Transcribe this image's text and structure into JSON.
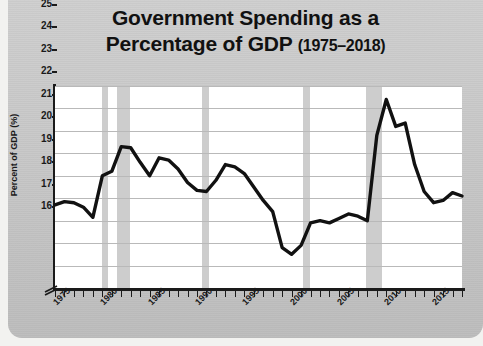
{
  "title": {
    "line1": "Government Spending as a",
    "line2": "Percentage of GDP",
    "years": "(1975–2018)"
  },
  "axes": {
    "ylabel": "Percent of GDP (%)",
    "y_ticks": [
      "25",
      "24",
      "23",
      "22",
      "21",
      "20",
      "19",
      "18",
      "17",
      "16"
    ],
    "x_ticks": [
      "1975",
      "1980",
      "1985",
      "1990",
      "1995",
      "2000",
      "2005",
      "2010",
      "2015"
    ],
    "axis_break": "axis-break-symbol"
  },
  "colors": {
    "line": "#111111",
    "grid": "#b9b9b9",
    "recession_band": "#c4c4c4",
    "panel": "#c8c8c8",
    "plot_bg": "#ffffff",
    "text": "#1a1a1a"
  },
  "chart_data": {
    "type": "line",
    "title": "Government Spending as a Percentage of GDP (1975–2018)",
    "xlabel": "",
    "ylabel": "Percent of GDP (%)",
    "xlim": [
      1975,
      2018
    ],
    "ylim": [
      16,
      25
    ],
    "grid": true,
    "legend": "none",
    "axis_break_y": true,
    "x": [
      1975,
      1976,
      1977,
      1978,
      1979,
      1980,
      1981,
      1982,
      1983,
      1984,
      1985,
      1986,
      1987,
      1988,
      1989,
      1990,
      1991,
      1992,
      1993,
      1994,
      1995,
      1996,
      1997,
      1998,
      1999,
      2000,
      2001,
      2002,
      2003,
      2004,
      2005,
      2006,
      2007,
      2008,
      2009,
      2010,
      2011,
      2012,
      2013,
      2014,
      2015,
      2016,
      2017,
      2018
    ],
    "values": [
      19.7,
      19.85,
      19.8,
      19.6,
      19.15,
      21.0,
      21.2,
      22.3,
      22.25,
      21.6,
      21.0,
      21.8,
      21.7,
      21.3,
      20.7,
      20.35,
      20.3,
      20.8,
      21.5,
      21.4,
      21.1,
      20.5,
      19.9,
      19.4,
      17.8,
      17.5,
      17.9,
      18.9,
      19.0,
      18.9,
      19.1,
      19.3,
      19.2,
      19.0,
      22.8,
      24.4,
      23.2,
      23.35,
      21.5,
      20.3,
      19.8,
      19.9,
      20.25,
      20.1
    ],
    "units": "percent of GDP",
    "recession_bands": [
      {
        "start": 1980.0,
        "end": 1980.6
      },
      {
        "start": 1981.5,
        "end": 1982.9
      },
      {
        "start": 1990.5,
        "end": 1991.3
      },
      {
        "start": 2001.2,
        "end": 2001.9
      },
      {
        "start": 2007.9,
        "end": 2009.5
      }
    ],
    "annotations": []
  }
}
